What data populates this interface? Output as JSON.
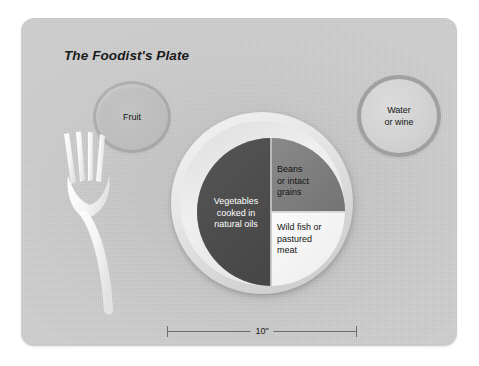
{
  "figure": {
    "title": "The Foodist's Plate",
    "background_color": "#ffffff"
  },
  "placemat": {
    "color": "#c8c8c8",
    "shape": "rounded-rectangle"
  },
  "items": {
    "fruit_bowl": {
      "label": "Fruit",
      "color": "#bdbdbd"
    },
    "water_glass": {
      "label_line1": "Water",
      "label_line2": "or wine",
      "color": "#d2d2d2",
      "rim_color": "#a0a0a0"
    },
    "fork": {
      "name": "fork",
      "color": "#f7f7f7"
    }
  },
  "plate": {
    "rim_color": "#e6e6e6",
    "diameter_label": "10\"",
    "sections": [
      {
        "id": "vegetables",
        "label_line1": "Vegetables",
        "label_line2": "cooked in",
        "label_line3": "natural oils",
        "share": "1/2",
        "color": "#4d4d4d",
        "text_color": "#ffffff"
      },
      {
        "id": "beans",
        "label_line1": "Beans",
        "label_line2": "or intact",
        "label_line3": "grains",
        "share": "1/4",
        "color": "#7c7c7c",
        "text_color": "#141414"
      },
      {
        "id": "fish",
        "label_line1": "Wild fish or",
        "label_line2": "pastured",
        "label_line3": "meat",
        "share": "1/4",
        "color": "#f2f2f2",
        "text_color": "#141414"
      }
    ]
  },
  "dimension": {
    "value": "10\"",
    "line_color": "#6e6e6e"
  }
}
